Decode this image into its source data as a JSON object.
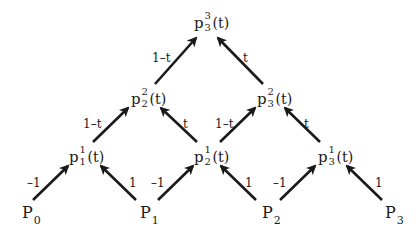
{
  "diagram": {
    "arrow_color": "#1a1a1a",
    "top_node": {
      "base": "p",
      "sup": "3",
      "sub": "3",
      "arg": "(t)"
    },
    "level2": [
      {
        "base": "p",
        "sup": "2",
        "sub": "2",
        "arg": "(t)"
      },
      {
        "base": "p",
        "sup": "2",
        "sub": "3",
        "arg": "(t)"
      }
    ],
    "level1": [
      {
        "base": "p",
        "sup": "1",
        "sub": "1",
        "arg": "(t)"
      },
      {
        "base": "p",
        "sup": "1",
        "sub": "2",
        "arg": "(t)"
      },
      {
        "base": "p",
        "sup": "1",
        "sub": "3",
        "arg": "(t)"
      }
    ],
    "control_points": [
      {
        "base": "P",
        "sub": "0"
      },
      {
        "base": "P",
        "sub": "1"
      },
      {
        "base": "P",
        "sub": "2"
      },
      {
        "base": "P",
        "sub": "3"
      }
    ],
    "weights": {
      "top_left": "1–t",
      "top_right": "t",
      "mid": [
        "1–t",
        "t",
        "1–t",
        "t"
      ],
      "bottom": [
        "–1",
        "1",
        "–1",
        "1",
        "–1",
        "1"
      ]
    }
  }
}
